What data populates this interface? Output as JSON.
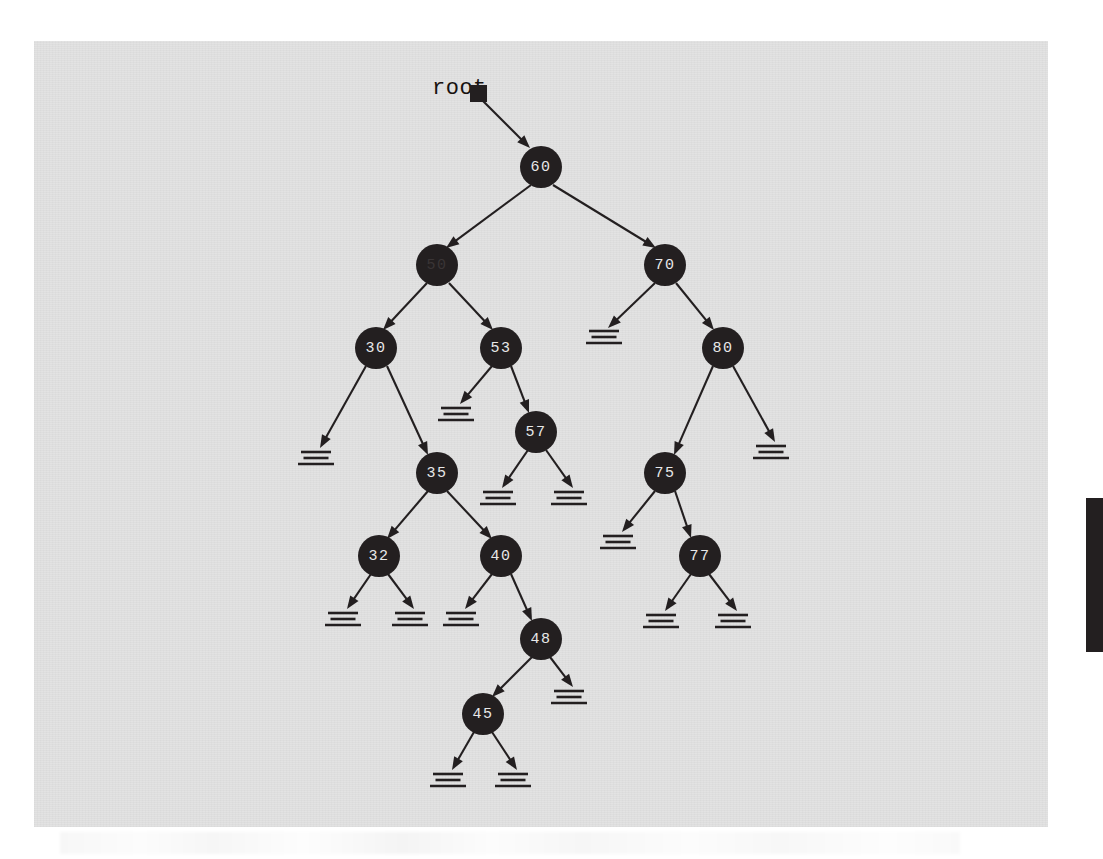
{
  "figure": {
    "type": "binary-search-tree-diagram",
    "root_pointer_label": "root",
    "colors": {
      "page_background": "#ffffff",
      "panel_background": "#e2e2e2",
      "ink": "#231f20",
      "node_fill": "#231f20",
      "node_text": "#e8e8e8",
      "edge_artifact": "#231f20"
    },
    "panel": {
      "x": 34,
      "y": 41,
      "width": 1014,
      "height": 786
    },
    "artifact": {
      "name": "scan-edge-bar",
      "x": 1086,
      "y": 498,
      "width": 17,
      "height": 154
    }
  },
  "tree": {
    "root_pointer": {
      "id": "rootptr",
      "label": "root",
      "x": 432,
      "y": 94,
      "box_x": 470,
      "box_y": 85,
      "box_size": 17
    },
    "nodes": [
      {
        "id": "n60",
        "value": "60",
        "x": 541,
        "y": 167,
        "r": 21,
        "faded": false
      },
      {
        "id": "n50",
        "value": "50",
        "x": 437,
        "y": 265,
        "r": 21,
        "faded": true
      },
      {
        "id": "n70",
        "value": "70",
        "x": 665,
        "y": 265,
        "r": 21,
        "faded": false
      },
      {
        "id": "n30",
        "value": "30",
        "x": 376,
        "y": 348,
        "r": 21,
        "faded": false
      },
      {
        "id": "n53",
        "value": "53",
        "x": 501,
        "y": 348,
        "r": 21,
        "faded": false
      },
      {
        "id": "n80",
        "value": "80",
        "x": 723,
        "y": 348,
        "r": 21,
        "faded": false
      },
      {
        "id": "n57",
        "value": "57",
        "x": 536,
        "y": 432,
        "r": 21,
        "faded": false
      },
      {
        "id": "n35",
        "value": "35",
        "x": 437,
        "y": 473,
        "r": 21,
        "faded": false
      },
      {
        "id": "n75",
        "value": "75",
        "x": 665,
        "y": 473,
        "r": 21,
        "faded": false
      },
      {
        "id": "n32",
        "value": "32",
        "x": 379,
        "y": 556,
        "r": 21,
        "faded": false
      },
      {
        "id": "n40",
        "value": "40",
        "x": 501,
        "y": 556,
        "r": 21,
        "faded": false
      },
      {
        "id": "n77",
        "value": "77",
        "x": 700,
        "y": 556,
        "r": 21,
        "faded": false
      },
      {
        "id": "n48",
        "value": "48",
        "x": 541,
        "y": 639,
        "r": 21,
        "faded": false
      },
      {
        "id": "n45",
        "value": "45",
        "x": 483,
        "y": 714,
        "r": 21,
        "faded": false
      }
    ],
    "edges": [
      {
        "id": "e-root-60",
        "from": "rootptr",
        "to": "n60",
        "x1": 482,
        "y1": 100,
        "x2": 530,
        "y2": 148
      },
      {
        "id": "e-60-50",
        "from": "n60",
        "to": "n50",
        "x1": 531,
        "y1": 185,
        "x2": 446,
        "y2": 248
      },
      {
        "id": "e-60-70",
        "from": "n60",
        "to": "n70",
        "x1": 553,
        "y1": 185,
        "x2": 656,
        "y2": 248
      },
      {
        "id": "e-50-30",
        "from": "n50",
        "to": "n30",
        "x1": 427,
        "y1": 283,
        "x2": 383,
        "y2": 330
      },
      {
        "id": "e-50-53",
        "from": "n50",
        "to": "n53",
        "x1": 449,
        "y1": 283,
        "x2": 493,
        "y2": 330
      },
      {
        "id": "e-70-null",
        "from": "n70",
        "to": "g70l",
        "x1": 655,
        "y1": 283,
        "x2": 608,
        "y2": 328
      },
      {
        "id": "e-70-80",
        "from": "n70",
        "to": "n80",
        "x1": 676,
        "y1": 283,
        "x2": 714,
        "y2": 330
      },
      {
        "id": "e-30-null",
        "from": "n30",
        "to": "g30l",
        "x1": 366,
        "y1": 366,
        "x2": 320,
        "y2": 448
      },
      {
        "id": "e-30-35",
        "from": "n30",
        "to": "n35",
        "x1": 387,
        "y1": 366,
        "x2": 428,
        "y2": 455
      },
      {
        "id": "e-53-null",
        "from": "n53",
        "to": "g53l",
        "x1": 492,
        "y1": 366,
        "x2": 460,
        "y2": 404
      },
      {
        "id": "e-53-57",
        "from": "n53",
        "to": "n57",
        "x1": 511,
        "y1": 366,
        "x2": 529,
        "y2": 413
      },
      {
        "id": "e-80-75",
        "from": "n80",
        "to": "n75",
        "x1": 713,
        "y1": 366,
        "x2": 674,
        "y2": 455
      },
      {
        "id": "e-80-null",
        "from": "n80",
        "to": "g80r",
        "x1": 733,
        "y1": 366,
        "x2": 775,
        "y2": 442
      },
      {
        "id": "e-57-nullL",
        "from": "n57",
        "to": "g57l",
        "x1": 528,
        "y1": 450,
        "x2": 502,
        "y2": 488
      },
      {
        "id": "e-57-nullR",
        "from": "n57",
        "to": "g57r",
        "x1": 546,
        "y1": 450,
        "x2": 573,
        "y2": 488
      },
      {
        "id": "e-35-32",
        "from": "n35",
        "to": "n32",
        "x1": 428,
        "y1": 491,
        "x2": 387,
        "y2": 539
      },
      {
        "id": "e-35-40",
        "from": "n35",
        "to": "n40",
        "x1": 447,
        "y1": 491,
        "x2": 492,
        "y2": 539
      },
      {
        "id": "e-75-null",
        "from": "n75",
        "to": "g75l",
        "x1": 655,
        "y1": 491,
        "x2": 622,
        "y2": 532
      },
      {
        "id": "e-75-77",
        "from": "n75",
        "to": "n77",
        "x1": 675,
        "y1": 491,
        "x2": 691,
        "y2": 538
      },
      {
        "id": "e-32-nullL",
        "from": "n32",
        "to": "g32l",
        "x1": 371,
        "y1": 574,
        "x2": 347,
        "y2": 609
      },
      {
        "id": "e-32-nullR",
        "from": "n32",
        "to": "g32r",
        "x1": 388,
        "y1": 574,
        "x2": 414,
        "y2": 609
      },
      {
        "id": "e-40-null",
        "from": "n40",
        "to": "g40l",
        "x1": 492,
        "y1": 574,
        "x2": 465,
        "y2": 609
      },
      {
        "id": "e-40-48",
        "from": "n40",
        "to": "n48",
        "x1": 511,
        "y1": 574,
        "x2": 532,
        "y2": 621
      },
      {
        "id": "e-77-nullL",
        "from": "n77",
        "to": "g77l",
        "x1": 691,
        "y1": 574,
        "x2": 665,
        "y2": 611
      },
      {
        "id": "e-77-nullR",
        "from": "n77",
        "to": "g77r",
        "x1": 709,
        "y1": 574,
        "x2": 737,
        "y2": 611
      },
      {
        "id": "e-48-45",
        "from": "n48",
        "to": "n45",
        "x1": 532,
        "y1": 657,
        "x2": 492,
        "y2": 697
      },
      {
        "id": "e-48-null",
        "from": "n48",
        "to": "g48r",
        "x1": 550,
        "y1": 657,
        "x2": 573,
        "y2": 687
      },
      {
        "id": "e-45-nullL",
        "from": "n45",
        "to": "g45l",
        "x1": 474,
        "y1": 732,
        "x2": 452,
        "y2": 770
      },
      {
        "id": "e-45-nullR",
        "from": "n45",
        "to": "g45r",
        "x1": 492,
        "y1": 732,
        "x2": 517,
        "y2": 770
      }
    ],
    "null_markers": [
      {
        "id": "g70l",
        "parent": "n70",
        "side": "left",
        "x": 604,
        "y": 331
      },
      {
        "id": "g30l",
        "parent": "n30",
        "side": "left",
        "x": 316,
        "y": 452
      },
      {
        "id": "g53l",
        "parent": "n53",
        "side": "left",
        "x": 456,
        "y": 408
      },
      {
        "id": "g80r",
        "parent": "n80",
        "side": "right",
        "x": 771,
        "y": 446
      },
      {
        "id": "g57l",
        "parent": "n57",
        "side": "left",
        "x": 498,
        "y": 492
      },
      {
        "id": "g57r",
        "parent": "n57",
        "side": "right",
        "x": 569,
        "y": 492
      },
      {
        "id": "g75l",
        "parent": "n75",
        "side": "left",
        "x": 618,
        "y": 536
      },
      {
        "id": "g32l",
        "parent": "n32",
        "side": "left",
        "x": 343,
        "y": 613
      },
      {
        "id": "g32r",
        "parent": "n32",
        "side": "right",
        "x": 410,
        "y": 613
      },
      {
        "id": "g40l",
        "parent": "n40",
        "side": "left",
        "x": 461,
        "y": 613
      },
      {
        "id": "g77l",
        "parent": "n77",
        "side": "left",
        "x": 661,
        "y": 615
      },
      {
        "id": "g77r",
        "parent": "n77",
        "side": "right",
        "x": 733,
        "y": 615
      },
      {
        "id": "g48r",
        "parent": "n48",
        "side": "right",
        "x": 569,
        "y": 691
      },
      {
        "id": "g45l",
        "parent": "n45",
        "side": "left",
        "x": 448,
        "y": 774
      },
      {
        "id": "g45r",
        "parent": "n45",
        "side": "right",
        "x": 513,
        "y": 774
      }
    ]
  }
}
